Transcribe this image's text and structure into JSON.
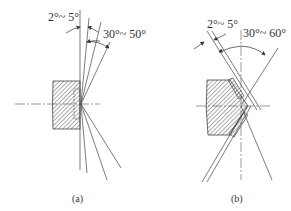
{
  "figure_a": {
    "caption": "(a)",
    "angle_small": "2°~ 5°",
    "angle_large": "30°~ 50°"
  },
  "figure_b": {
    "caption": "(b)",
    "angle_small": "2°~ 5°",
    "angle_large": "30°~ 60°"
  },
  "colors": {
    "line": "#444444",
    "hatch": "#555555",
    "background": "#ffffff"
  }
}
